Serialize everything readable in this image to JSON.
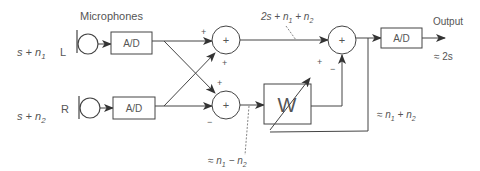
{
  "diagram": {
    "title": "Microphones",
    "inputs": [
      {
        "channel": "L",
        "signal_main": "s + n",
        "signal_sub": "1"
      },
      {
        "channel": "R",
        "signal_main": "s + n",
        "signal_sub": "2"
      }
    ],
    "blocks": {
      "adc_left": "A/D",
      "adc_right": "A/D",
      "adc_out": "A/D",
      "filter": "W",
      "sum_symbol": "+"
    },
    "signs": {
      "sum1_top": "+",
      "sum1_bottom": "+",
      "sum2_top": "+",
      "sum2_bottom": "−",
      "sum3_left": "+",
      "sum3_bottom": "−"
    },
    "annotations": {
      "sum_label": {
        "pre": "2s + n",
        "s1": "1",
        "mid": " + n",
        "s2": "2"
      },
      "diff_label": {
        "pre": "≈ n",
        "s1": "1",
        "mid": " − n",
        "s2": "2"
      },
      "noise_label": {
        "pre": "≈ n",
        "s1": "1",
        "mid": " + n",
        "s2": "2"
      },
      "output_title": "Output",
      "output_value": "≈ 2s"
    },
    "colors": {
      "line": "#444444",
      "text": "#555555"
    }
  }
}
